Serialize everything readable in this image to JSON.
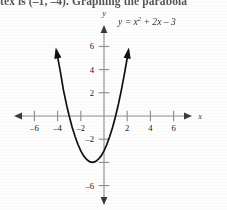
{
  "header": {
    "text": "tex is (–1, –4). Graphing the parabola"
  },
  "figure": {
    "equation_prefix": "y = x",
    "equation_exponent": "2",
    "equation_suffix": " + 2x – 3",
    "x_axis_name": "x",
    "y_axis_name": "y"
  },
  "chart_data": {
    "type": "line",
    "title": "",
    "subtitle": "",
    "xlabel": "x",
    "ylabel": "y",
    "annotations": [
      "y = x2 + 2x – 3"
    ],
    "legend": [],
    "legend_position": "none",
    "grid": false,
    "xlim": [
      -7.5,
      7.5
    ],
    "ylim": [
      -7.5,
      7.5
    ],
    "xticks": [
      -6,
      -4,
      -2,
      2,
      4,
      6
    ],
    "xtick_labels": [
      "–6",
      "–4",
      "–2",
      "2",
      "4",
      "6"
    ],
    "yticks": [
      6,
      4,
      2,
      -2,
      -6
    ],
    "ytick_labels": [
      "6",
      "4",
      "2",
      "–2",
      "–6"
    ],
    "series": [
      {
        "name": "y = x2 + 2x – 3",
        "equation": "y = x^2 + 2x - 3",
        "vertex": [
          -1,
          -4
        ],
        "roots": [
          -3,
          1
        ],
        "y_intercept": -3,
        "x": [
          -4.1,
          -3.8,
          -3.5,
          -3.2,
          -3.0,
          -2.75,
          -2.5,
          -2.25,
          -2.0,
          -1.75,
          -1.5,
          -1.25,
          -1.0,
          -0.75,
          -0.5,
          -0.25,
          0.0,
          0.25,
          0.5,
          0.75,
          1.0,
          1.25,
          1.5,
          1.75,
          2.0,
          2.1
        ],
        "values": [
          5.61,
          4.04,
          2.25,
          0.84,
          0.0,
          -0.94,
          -1.75,
          -2.44,
          -3.0,
          -3.44,
          -3.75,
          -3.94,
          -4.0,
          -3.94,
          -3.75,
          -3.44,
          -3.0,
          -2.44,
          -1.75,
          -0.94,
          0.0,
          1.06,
          2.25,
          3.56,
          5.0,
          5.61
        ]
      }
    ]
  }
}
